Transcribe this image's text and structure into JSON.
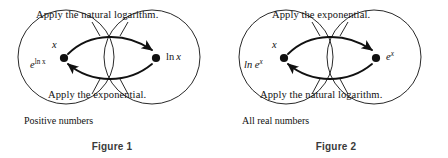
{
  "figures": [
    {
      "id": "figure-1",
      "caption": "Figure 1",
      "set_label": "Positive numbers",
      "forward_label": "Apply the natural logarithm.",
      "backward_label": "Apply the exponential.",
      "left_node": {
        "top_text": "x",
        "bottom_base": "e",
        "bottom_exponent": "ln x"
      },
      "right_node": {
        "label_function": "ln",
        "label_argument": "x"
      }
    },
    {
      "id": "figure-2",
      "caption": "Figure 2",
      "set_label": "All real numbers",
      "forward_label": "Apply the exponential.",
      "backward_label": "Apply the natural logarithm.",
      "left_node": {
        "top_text": "x",
        "bottom_base": "ln e",
        "bottom_exponent": "x"
      },
      "right_node": {
        "label_function": "e",
        "label_argument": "x"
      }
    }
  ],
  "style": {
    "stroke_color": "#111111",
    "background_color": "#ffffff",
    "caption_color": "#3a3a3a"
  }
}
